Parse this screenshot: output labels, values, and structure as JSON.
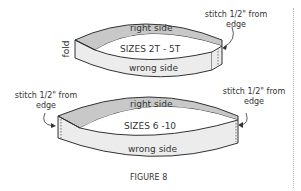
{
  "figure": {
    "caption": "FIGURE 8",
    "top_band": {
      "size_label": "SIZES 2T - 5T",
      "outer_label": "right side",
      "inner_label": "wrong side",
      "fold_label": "fold",
      "note_line1": "stitch 1/2\" from",
      "note_line2": "edge"
    },
    "bottom_band": {
      "size_label": "SIZES 6 -10",
      "outer_label": "right side",
      "inner_label": "wrong side",
      "left_note_line1": "stitch 1/2\" from",
      "left_note_line2": "edge",
      "right_note_line1": "stitch 1/2\" from",
      "right_note_line2": "edge"
    }
  },
  "colors": {
    "outer_fill": "#c8c8c8",
    "inner_fill": "#ececec",
    "stroke": "#333333",
    "text": "#333333"
  }
}
